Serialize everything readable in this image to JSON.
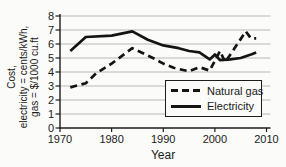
{
  "figure": {
    "background": "#fbfbf9",
    "line_color": "#141414",
    "grid_color": "#b8b8b8",
    "axis_color": "#1d1d1d",
    "text_color": "#1a1a1a"
  },
  "chart_data": {
    "type": "line",
    "title": "",
    "xlabel": "Year",
    "ylabel_lines": [
      "Cost,",
      "electricity = cents/kWh,",
      "gas = $/1000 cu.ft"
    ],
    "xlim": [
      1970,
      2010
    ],
    "ylim": [
      0,
      8
    ],
    "x_ticks": [
      1970,
      1980,
      1990,
      2000,
      2010
    ],
    "y_ticks": [
      0,
      1,
      2,
      3,
      4,
      5,
      6,
      7,
      8
    ],
    "grid": "horizontal",
    "legend_position": "lower-right",
    "series": [
      {
        "name": "Natural gas",
        "style": "dashed",
        "points": [
          [
            1972,
            2.9
          ],
          [
            1975,
            3.2
          ],
          [
            1977,
            3.9
          ],
          [
            1980,
            4.6
          ],
          [
            1984,
            5.7
          ],
          [
            1988,
            5.0
          ],
          [
            1990,
            4.6
          ],
          [
            1992,
            4.3
          ],
          [
            1995,
            4.05
          ],
          [
            1997,
            4.35
          ],
          [
            1999,
            4.1
          ],
          [
            2001,
            5.5
          ],
          [
            2002,
            4.7
          ],
          [
            2004,
            5.8
          ],
          [
            2006,
            6.9
          ],
          [
            2007,
            6.4
          ],
          [
            2008,
            6.4
          ]
        ]
      },
      {
        "name": "Electricity",
        "style": "solid",
        "points": [
          [
            1972,
            5.5
          ],
          [
            1975,
            6.5
          ],
          [
            1980,
            6.6
          ],
          [
            1984,
            6.9
          ],
          [
            1987,
            6.3
          ],
          [
            1990,
            5.9
          ],
          [
            1993,
            5.7
          ],
          [
            1995,
            5.5
          ],
          [
            1997,
            5.4
          ],
          [
            1999,
            4.9
          ],
          [
            2000,
            5.25
          ],
          [
            2001,
            4.85
          ],
          [
            2003,
            4.9
          ],
          [
            2005,
            5.0
          ],
          [
            2007,
            5.25
          ],
          [
            2008,
            5.4
          ]
        ]
      }
    ]
  }
}
